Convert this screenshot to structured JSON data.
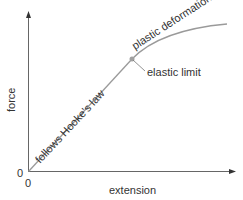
{
  "diagram": {
    "y_axis_label": "force",
    "x_axis_label": "extension",
    "origin_y_label": "0",
    "origin_x_label": "0",
    "linear_region_label": "follows Hooke's law",
    "plastic_region_label": "plastic deformation",
    "elastic_limit_label": "elastic limit",
    "colors": {
      "axis": "#666666",
      "curve": "#9a9a9a",
      "point": "#a0a0a0",
      "text": "#333333"
    }
  }
}
